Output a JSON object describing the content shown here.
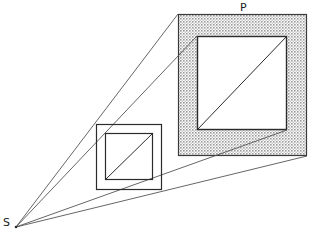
{
  "figure": {
    "title": "",
    "background_color": "#ffffff",
    "line_color": "#2b2b2b",
    "ray_color": "#555555",
    "shade_color": "#b3b3b3",
    "labels": {
      "source": "S",
      "plane": "P"
    },
    "label_positions": {
      "source": {
        "x": 3,
        "y": 226
      },
      "plane": {
        "x": 240,
        "y": 11
      }
    },
    "source_point": {
      "x": 16,
      "y": 227
    },
    "shapes": {
      "shaded_outer_square": {
        "x": 178,
        "y": 14,
        "width": 129,
        "height": 142
      },
      "shaded_inner_square": {
        "x": 197,
        "y": 36,
        "width": 90,
        "height": 94
      },
      "small_outer_square": {
        "x": 96,
        "y": 124,
        "width": 66,
        "height": 66
      },
      "small_inner_square": {
        "x": 105,
        "y": 133,
        "width": 48,
        "height": 47
      }
    },
    "diagonals": [
      {
        "name": "small-square-diagonal",
        "x1": 105,
        "y1": 180,
        "x2": 153,
        "y2": 133
      },
      {
        "name": "shaded-square-diagonal",
        "x1": 197,
        "y1": 130,
        "x2": 287,
        "y2": 36
      }
    ],
    "rays": [
      {
        "name": "ray-to-outer-top-left",
        "x1": 16,
        "y1": 227,
        "x2": 197,
        "y2": 36
      },
      {
        "name": "ray-to-inner-top-left",
        "x1": 16,
        "y1": 227,
        "x2": 178,
        "y2": 14
      },
      {
        "name": "ray-to-inner-bottom-right",
        "x1": 16,
        "y1": 227,
        "x2": 287,
        "y2": 130
      },
      {
        "name": "ray-to-outer-bottom-right",
        "x1": 16,
        "y1": 227,
        "x2": 307,
        "y2": 156
      }
    ]
  }
}
